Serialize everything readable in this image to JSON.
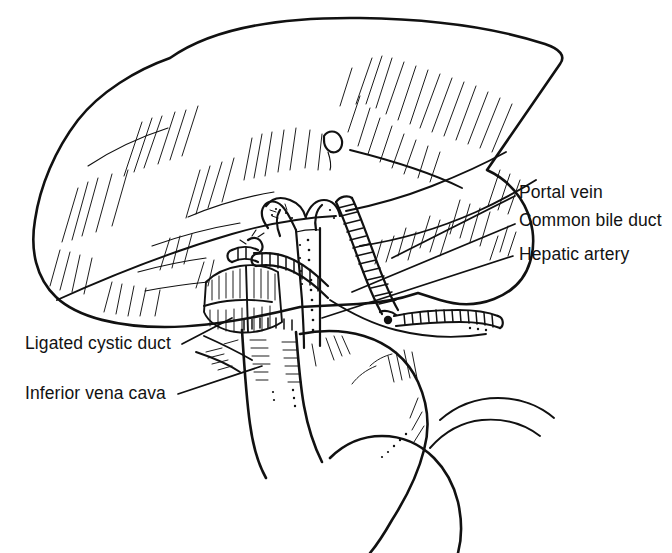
{
  "figure": {
    "kind": "line-drawing",
    "background_color": "#ffffff",
    "ink_color": "#111111",
    "canvas": {
      "width": 672,
      "height": 553
    }
  },
  "labels": {
    "right": [
      {
        "id": "portal-vein",
        "text": "Portal vein",
        "x": 519,
        "y": 184,
        "leader_from": [
          515,
          196
        ],
        "leader_to": [
          392,
          258
        ]
      },
      {
        "id": "common-bile-duct",
        "text": "Common bile duct",
        "x": 519,
        "y": 212,
        "leader_from": [
          515,
          224
        ],
        "leader_to": [
          352,
          292
        ]
      },
      {
        "id": "hepatic-artery",
        "text": "Hepatic artery",
        "x": 519,
        "y": 246,
        "leader_from": [
          513,
          256
        ],
        "leader_to": [
          322,
          318
        ]
      }
    ],
    "left": [
      {
        "id": "ligated-cystic-duct",
        "text": "Ligated cystic duct",
        "x": 25,
        "y": 335,
        "leader_from": [
          182,
          344
        ],
        "leader_to": [
          230,
          318
        ]
      },
      {
        "id": "inferior-vena-cava",
        "text": "Inferior vena cava",
        "x": 25,
        "y": 385,
        "leader_from": [
          178,
          394
        ],
        "leader_to": [
          262,
          366
        ]
      }
    ]
  },
  "structures": [
    {
      "id": "liver",
      "name": "Liver (anterior/inferior view)",
      "texture": "parallel hatching"
    },
    {
      "id": "portal-vein",
      "name": "Portal vein",
      "texture": "stippled tube, Y-shaped bifurcation"
    },
    {
      "id": "common-bile-duct",
      "name": "Common bile duct",
      "texture": "cross-hatched tube"
    },
    {
      "id": "hepatic-artery",
      "name": "Hepatic artery",
      "texture": "cross-hatched tube with ligature"
    },
    {
      "id": "ligated-cystic-duct",
      "name": "Ligated cystic duct",
      "texture": "short stump with tie"
    },
    {
      "id": "inferior-vena-cava",
      "name": "Inferior vena cava",
      "texture": "broad smooth tube, hatched margin"
    },
    {
      "id": "duodenum",
      "name": "Duodenum",
      "texture": "smooth curved tube"
    },
    {
      "id": "gallbladder-bed",
      "name": "Gallbladder bed",
      "texture": "hatched raw surface"
    }
  ]
}
